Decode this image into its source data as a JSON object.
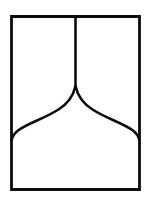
{
  "image": {
    "kind": "line-drawing",
    "background_color": "#ffffff",
    "ink_color": "#0d0d0d",
    "width": 151,
    "height": 207,
    "description": "Black outline drawing of an upright rectangle containing a vertical center line that descends to a sharp cusp, from which two mirrored S-curves sweep outward and down to the left and right walls, forming an ogee arch."
  },
  "geometry": {
    "frame": {
      "name": "outer-rectangle",
      "left": 11.5,
      "top": 16.5,
      "right": 139.5,
      "bottom": 189.5,
      "stroke_width": 2.8,
      "path": "M 11.5 16.5 L 139.5 16.5 L 139.5 189.5 L 11.5 189.5 Z"
    },
    "center_line": {
      "name": "vertical-center-line",
      "x": 75.5,
      "y_top": 16.5,
      "y_bottom": 86.5,
      "stroke_width": 2.6,
      "path": "M 75.5 16.5 L 75.5 86.0"
    },
    "left_curve": {
      "name": "left-ogee-curve",
      "start": [
        75.5,
        86.0
      ],
      "end": [
        11.5,
        140.5
      ],
      "stroke_width": 2.6,
      "path": "M 75.5 86.0 C 73.2 96.5 68.0 103.5 58.5 109.5 C 44.0 118.8 27.0 123.5 18.0 130.5 C 14.4 133.3 12.4 136.4 11.5 140.5"
    },
    "right_curve": {
      "name": "right-ogee-curve",
      "start": [
        75.5,
        86.0
      ],
      "end": [
        139.5,
        140.5
      ],
      "stroke_width": 2.6,
      "path": "M 75.5 86.0 C 77.8 96.5 83.0 103.5 92.5 109.5 C 107.0 118.8 124.0 123.5 133.0 130.5 C 136.6 133.3 138.6 136.4 139.5 140.5"
    }
  }
}
